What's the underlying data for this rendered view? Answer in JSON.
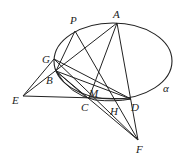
{
  "diagram": {
    "type": "geometry",
    "ellipse": {
      "name": "α",
      "cx": 113,
      "cy": 61,
      "rx": 59,
      "ry": 38
    },
    "points": {
      "A": {
        "label": "A",
        "x": 117,
        "y": 23
      },
      "P": {
        "label": "P",
        "x": 75,
        "y": 31
      },
      "G": {
        "label": "G",
        "x": 54,
        "y": 59
      },
      "B": {
        "label": "B",
        "x": 56,
        "y": 71
      },
      "E": {
        "label": "E",
        "x": 23,
        "y": 96
      },
      "M": {
        "label": "M",
        "x": 89,
        "y": 98
      },
      "C": {
        "label": "C",
        "x": 87,
        "y": 98
      },
      "H": {
        "label": "H",
        "x": 116,
        "y": 100
      },
      "D": {
        "label": "D",
        "x": 131,
        "y": 99
      },
      "F": {
        "label": "F",
        "x": 138,
        "y": 140
      }
    },
    "segments": [
      [
        "E",
        "A"
      ],
      [
        "E",
        "G"
      ],
      [
        "E",
        "D"
      ],
      [
        "A",
        "M"
      ],
      [
        "A",
        "F"
      ],
      [
        "A",
        "C"
      ],
      [
        "P",
        "B"
      ],
      [
        "P",
        "F"
      ],
      [
        "G",
        "F"
      ],
      [
        "G",
        "D"
      ],
      [
        "B",
        "F"
      ],
      [
        "B",
        "D"
      ],
      [
        "B",
        "C"
      ]
    ],
    "curve_label": "α"
  }
}
